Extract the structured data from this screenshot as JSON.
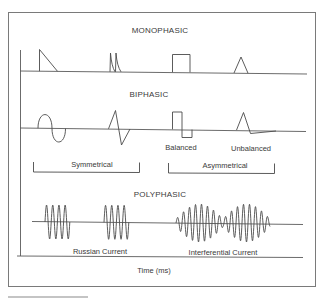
{
  "diagram": {
    "sections": [
      {
        "id": "monophasic",
        "title": "MONOPHASIC",
        "waveforms": [
          {
            "name": "sawtooth-pulse"
          },
          {
            "name": "twin-spike"
          },
          {
            "name": "rectangular-pulse"
          },
          {
            "name": "triangular-pulse"
          }
        ]
      },
      {
        "id": "biphasic",
        "title": "BIPHASIC",
        "waveforms": [
          {
            "name": "sine-biphasic"
          },
          {
            "name": "triangular-biphasic"
          },
          {
            "name": "balanced-rectangular",
            "label": "Balanced"
          },
          {
            "name": "unbalanced-triangular",
            "label": "Unbalanced"
          }
        ],
        "groups": [
          {
            "label": "Symmetrical"
          },
          {
            "label": "Asymmetrical"
          }
        ]
      },
      {
        "id": "polyphasic",
        "title": "POLYPHASIC",
        "waveforms": [
          {
            "name": "russian-current",
            "label": "Russian Current",
            "bursts": 2,
            "cycles_per_burst": 4
          },
          {
            "name": "interferential-current",
            "label": "Interferential Current"
          }
        ]
      }
    ],
    "x_axis_label": "Time (ms)"
  }
}
